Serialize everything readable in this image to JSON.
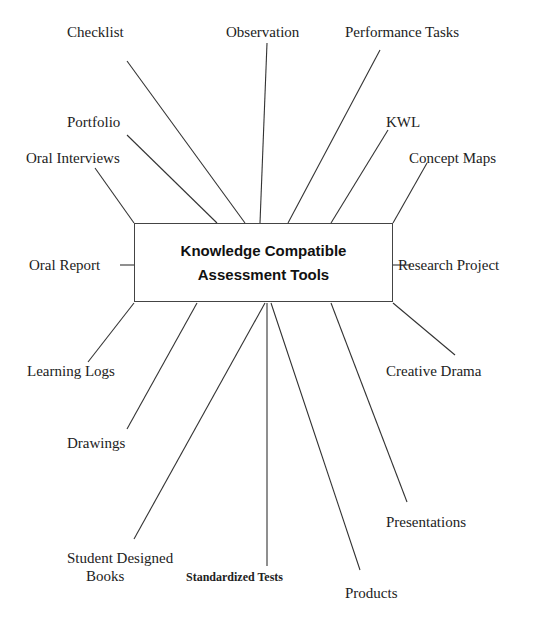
{
  "diagram": {
    "center": {
      "line1": "Knowledge Compatible",
      "line2": "Assessment Tools"
    },
    "nodes": [
      {
        "id": "checklist",
        "label": "Checklist"
      },
      {
        "id": "observation",
        "label": "Observation"
      },
      {
        "id": "performance-tasks",
        "label": "Performance Tasks"
      },
      {
        "id": "portfolio",
        "label": "Portfolio"
      },
      {
        "id": "kwl",
        "label": "KWL"
      },
      {
        "id": "oral-interviews",
        "label": "Oral Interviews"
      },
      {
        "id": "concept-maps",
        "label": "Concept Maps"
      },
      {
        "id": "oral-report",
        "label": "Oral   Report"
      },
      {
        "id": "research-project",
        "label": "Research Project"
      },
      {
        "id": "learning-logs",
        "label": "Learning Logs"
      },
      {
        "id": "creative-drama",
        "label": "Creative Drama"
      },
      {
        "id": "drawings",
        "label": "Drawings"
      },
      {
        "id": "presentations",
        "label": "Presentations"
      },
      {
        "id": "student-designed-books",
        "label": "Student Designed",
        "label2": "Books"
      },
      {
        "id": "standardized-tests",
        "label": "Standardized Tests"
      },
      {
        "id": "products",
        "label": "Products"
      }
    ]
  }
}
